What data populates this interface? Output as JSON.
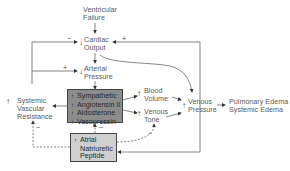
{
  "diagram": {
    "nodes": {
      "ventricular_failure": {
        "line1": "Ventricular",
        "line2": "Failure"
      },
      "cardiac_output": {
        "direction": "↓",
        "line1": "Cardiac",
        "line2": "Output"
      },
      "arterial_pressure": {
        "direction": "↓",
        "line1": "Arterial",
        "line2": "Pressure"
      },
      "neurohormonal": {
        "items": [
          {
            "bullet": "↑",
            "label": "Sympathetic"
          },
          {
            "bullet": "↑",
            "label": "Angiotensin II"
          },
          {
            "bullet": "↑",
            "label": "Aldosterone"
          },
          {
            "bullet": "↑",
            "label": "Vasopressin"
          }
        ]
      },
      "anp": {
        "direction": "↑",
        "line1": "Atrial",
        "line2": "Natriuretic",
        "line3": "Peptide"
      },
      "svr": {
        "direction": "↑",
        "line1": "Systemic",
        "line2": "Vascular",
        "line3": "Resistance"
      },
      "blood_volume": {
        "direction": "↑",
        "line1": "Blood",
        "line2": "Volume"
      },
      "venous_tone": {
        "direction": "↑",
        "line1": "Venous",
        "line2": "Tone"
      },
      "venous_pressure": {
        "direction": "↑",
        "line1": "Venous",
        "line2": "Pressure"
      },
      "edema": {
        "line1": "Pulmonary Edema",
        "line2": "Systemic Edema"
      }
    },
    "signs": {
      "svr_to_co": "−",
      "vp_to_co": "+",
      "svr_to_ap": "+",
      "anp_to_neuro": "−",
      "anp_to_svr": "−",
      "anp_to_tone": "−"
    },
    "colors": {
      "dark_box": "#8c8c8c",
      "light_box": "#cfcfcf",
      "line": "#666666"
    }
  }
}
